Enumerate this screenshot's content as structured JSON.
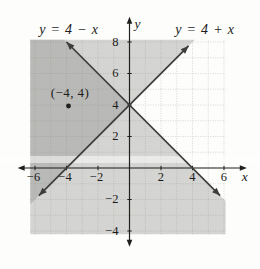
{
  "colors": {
    "background": "#fdfdfb",
    "shade": "#83837f",
    "shade_alpha": 0.33,
    "grid": "#c6c7c3",
    "axis": "#1f1f1d",
    "line": "#3d3d3b",
    "text": "#1c1c1a"
  },
  "chart_data": {
    "type": "line",
    "equations": [
      {
        "label": "y = 4 − x",
        "slope": -1,
        "intercept": 4,
        "endpoints": [
          [
            -4.0,
            8.0
          ],
          [
            5.75,
            -1.75
          ]
        ],
        "label_anchor_px": [
          69,
          34
        ]
      },
      {
        "label": "y = 4 + x",
        "slope": 1,
        "intercept": 4,
        "endpoints": [
          [
            -5.75,
            -1.75
          ],
          [
            3.75,
            7.75
          ]
        ],
        "label_anchor_px": [
          205,
          34
        ]
      }
    ],
    "point": {
      "x": -4,
      "y": 4,
      "label": "(−4, 4)",
      "label_anchor_px": [
        70,
        97
      ]
    },
    "x_ticks": [
      {
        "v": -6,
        "label": "−6"
      },
      {
        "v": -4,
        "label": "−4"
      },
      {
        "v": -2,
        "label": "−2"
      },
      {
        "v": 2,
        "label": "2"
      },
      {
        "v": 4,
        "label": "4"
      },
      {
        "v": 6,
        "label": "6"
      }
    ],
    "y_ticks": [
      {
        "v": 8,
        "label": "8"
      },
      {
        "v": 6,
        "label": "6"
      },
      {
        "v": 4,
        "label": "4"
      },
      {
        "v": 2,
        "label": "2"
      },
      {
        "v": -2,
        "label": "−2"
      },
      {
        "v": -4,
        "label": "−4"
      }
    ],
    "axes": {
      "x_label": "x",
      "y_label": "y",
      "x_range": [
        -7.1,
        7.45
      ],
      "y_range": [
        -5.0,
        9.6
      ]
    },
    "graph_rect": {
      "x": [
        -6.3,
        6.1
      ],
      "y": [
        -4.2,
        8.15
      ]
    },
    "grid_step": 1,
    "shaded_regions": [
      {
        "name": "half-plane-below-y-equals-4-minus-x",
        "points": [
          [
            -6.3,
            8.15
          ],
          [
            -4.15,
            8.15
          ],
          [
            6.1,
            -2.1
          ],
          [
            6.1,
            -4.2
          ],
          [
            -6.3,
            -4.2
          ]
        ]
      },
      {
        "name": "half-plane-above-y-equals-4-plus-x",
        "points": [
          [
            -6.3,
            -2.3
          ],
          [
            4.15,
            8.15
          ],
          [
            -6.3,
            8.15
          ]
        ]
      }
    ],
    "origin_px": [
      129.5,
      168
    ],
    "unit_px": 15.75
  }
}
